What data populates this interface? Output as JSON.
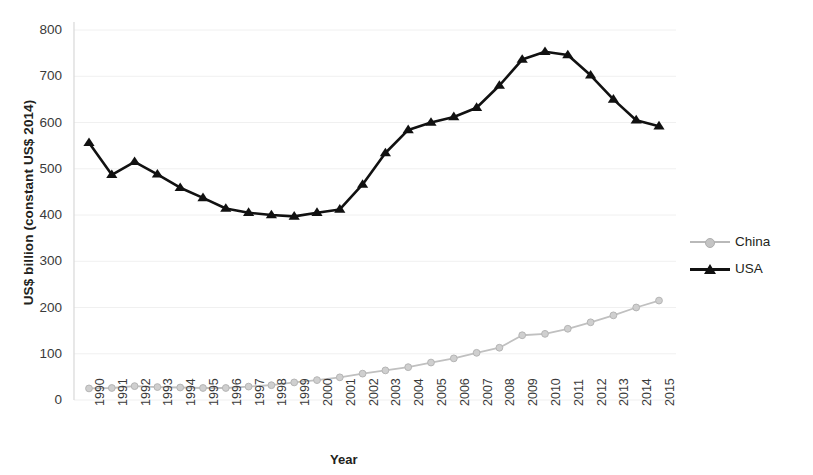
{
  "chart_data": {
    "type": "line",
    "title": "",
    "xlabel": "Year",
    "ylabel": "US$ billion (constant US$ 2014)",
    "x": [
      1990,
      1991,
      1992,
      1993,
      1994,
      1995,
      1996,
      1997,
      1998,
      1999,
      2000,
      2001,
      2002,
      2003,
      2004,
      2005,
      2006,
      2007,
      2008,
      2009,
      2010,
      2011,
      2012,
      2013,
      2014,
      2015
    ],
    "categories": [
      "1990",
      "1991",
      "1992",
      "1993",
      "1994",
      "1995",
      "1996",
      "1997",
      "1998",
      "1999",
      "2000",
      "2001",
      "2002",
      "2003",
      "2004",
      "2005",
      "2006",
      "2007",
      "2008",
      "2009",
      "2010",
      "2011",
      "2012",
      "2013",
      "2014",
      "2015"
    ],
    "series": [
      {
        "name": "China",
        "color": "#c0c0c0",
        "marker": "circle",
        "values": [
          25,
          26,
          30,
          28,
          27,
          26,
          26,
          29,
          32,
          38,
          43,
          49,
          57,
          64,
          71,
          81,
          90,
          102,
          113,
          140,
          143,
          154,
          168,
          183,
          200,
          215
        ]
      },
      {
        "name": "USA",
        "color": "#111111",
        "marker": "triangle",
        "values": [
          556,
          487,
          515,
          488,
          459,
          437,
          414,
          405,
          400,
          397,
          405,
          412,
          466,
          534,
          584,
          600,
          612,
          632,
          680,
          736,
          753,
          746,
          702,
          650,
          605,
          592
        ]
      }
    ],
    "ylim": [
      0,
      800
    ],
    "yticks": [
      0,
      100,
      200,
      300,
      400,
      500,
      600,
      700,
      800
    ],
    "ytick_labels": [
      "0",
      "100",
      "200",
      "300",
      "400",
      "500",
      "600",
      "700",
      "800"
    ],
    "grid": true,
    "grid_color": "#f0f0f0",
    "legend_position": "right"
  },
  "legend": {
    "items": [
      {
        "label": "China"
      },
      {
        "label": "USA"
      }
    ]
  },
  "axes": {
    "y_title": "US$ billion (constant US$ 2014)",
    "x_title": "Year"
  }
}
